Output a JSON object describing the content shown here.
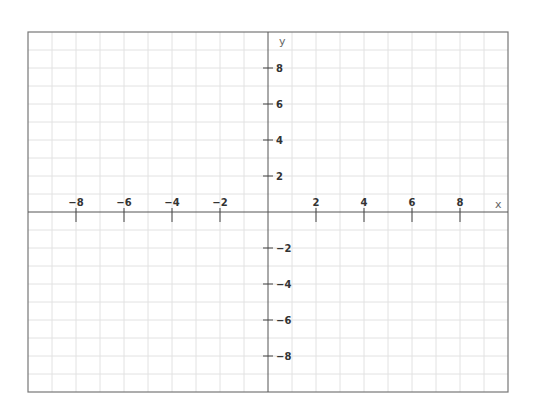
{
  "chart_data": {
    "type": "scatter",
    "title": "",
    "xlabel": "x",
    "ylabel": "y",
    "xlim": [
      -10,
      10
    ],
    "ylim": [
      -10,
      10
    ],
    "grid": true,
    "grid_step": 1,
    "tick_step": 2,
    "x_ticks": [
      -8,
      -6,
      -4,
      -2,
      2,
      4,
      6,
      8
    ],
    "y_ticks": [
      -8,
      -6,
      -4,
      -2,
      2,
      4,
      6,
      8
    ],
    "x_tick_labels": [
      "−8",
      "−6",
      "−4",
      "−2",
      "2",
      "4",
      "6",
      "8"
    ],
    "y_tick_labels": [
      "−8",
      "−6",
      "−4",
      "−2",
      "2",
      "4",
      "6",
      "8"
    ],
    "series": [],
    "legend": null
  },
  "colors": {
    "background": "#ffffff",
    "grid": "#e2e2e2",
    "border": "#777777",
    "axis": "#555555",
    "tick_label": "#333333",
    "axis_name": "#666666"
  },
  "layout": {
    "left": 28,
    "right": 508,
    "top": 32,
    "bottom": 392,
    "origin_x": 268,
    "origin_y": 212,
    "unit_x": 24,
    "unit_y": 18
  }
}
